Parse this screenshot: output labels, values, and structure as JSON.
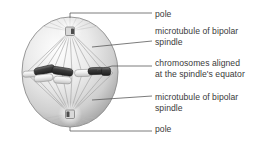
{
  "figure": {
    "background_color": "#ffffff",
    "text_color": "#3a3a3a",
    "leader_color": "#5a5a5a",
    "cell": {
      "name": "dividing cell",
      "center_x": 70,
      "center_y": 72,
      "radius_x": 48,
      "radius_y": 55,
      "fill_light": "#fdfdfd",
      "fill_mid": "#d8d8d8",
      "fill_dark": "#9c9c9c",
      "outline": "#8a8a8a"
    },
    "poles": [
      {
        "name": "top-pole",
        "x": 70,
        "y": 31
      },
      {
        "name": "bottom-pole",
        "x": 70,
        "y": 114
      }
    ],
    "equator_y": 73,
    "chromosomes": [
      {
        "x": 30,
        "y": 74,
        "w": 15,
        "h": 6,
        "angle": 0,
        "shade": "#e8e8e8"
      },
      {
        "x": 44,
        "y": 69,
        "w": 20,
        "h": 8,
        "angle": -12,
        "shade": "#4a4a4a"
      },
      {
        "x": 43,
        "y": 77,
        "w": 18,
        "h": 7,
        "angle": -6,
        "shade": "#efefef"
      },
      {
        "x": 62,
        "y": 71,
        "w": 20,
        "h": 8,
        "angle": 8,
        "shade": "#3f3f3f"
      },
      {
        "x": 62,
        "y": 79,
        "w": 17,
        "h": 7,
        "angle": 4,
        "shade": "#e4e4e4"
      },
      {
        "x": 82,
        "y": 73,
        "w": 17,
        "h": 7,
        "angle": 0,
        "shade": "#ededed"
      },
      {
        "x": 95,
        "y": 71,
        "w": 16,
        "h": 7,
        "angle": 0,
        "shade": "#4a4a4a"
      },
      {
        "x": 105,
        "y": 72,
        "w": 9,
        "h": 8,
        "angle": 0,
        "shade": "#555555"
      }
    ]
  },
  "labels": [
    {
      "id": "pole-top",
      "text": "pole",
      "x": 155,
      "y": 9
    },
    {
      "id": "microtubule-top-1",
      "text": "microtubule of bipolar",
      "x": 155,
      "y": 26
    },
    {
      "id": "microtubule-top-2",
      "text": "spindle",
      "x": 155,
      "y": 37
    },
    {
      "id": "chromosomes-1",
      "text": "chromosomes aligned",
      "x": 155,
      "y": 58
    },
    {
      "id": "chromosomes-2",
      "text": "at the spindle's equator",
      "x": 155,
      "y": 69
    },
    {
      "id": "microtubule-bot-1",
      "text": "microtubule of bipolar",
      "x": 155,
      "y": 92
    },
    {
      "id": "microtubule-bot-2",
      "text": "spindle",
      "x": 155,
      "y": 103
    },
    {
      "id": "pole-bottom",
      "text": "pole",
      "x": 155,
      "y": 124
    }
  ],
  "leaders": [
    {
      "id": "leader-pole-top",
      "d": "M 70 18 L 70 13 L 152 13"
    },
    {
      "id": "leader-microtubule-top",
      "d": "M 92 47 L 152 41"
    },
    {
      "id": "leader-chromosomes",
      "d": "M 97 70 L 112 66 L 152 66"
    },
    {
      "id": "leader-microtubule-bottom",
      "d": "M 92 100 L 152 96"
    },
    {
      "id": "leader-pole-bottom",
      "d": "M 70 127 L 70 131 L 152 131"
    }
  ]
}
